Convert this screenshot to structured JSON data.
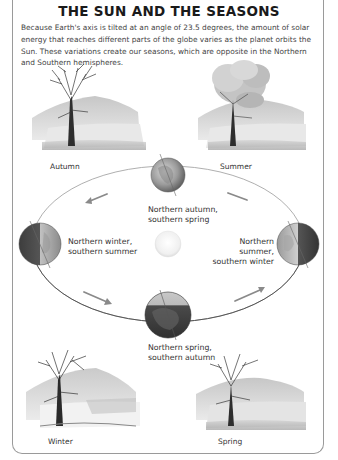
{
  "title": "THE SUN AND THE SEASONS",
  "intro": "Because Earth's axis is tilted at an angle of 23.5 degrees, the amount of solar energy that reaches different parts of the globe varies as the planet orbits the Sun. These variations create our seasons, which are opposite in the Northern and Southern hemispheres.",
  "scenes": [
    {
      "id": "autumn",
      "label": "Autumn"
    },
    {
      "id": "summer",
      "label": "Summer"
    },
    {
      "id": "winter",
      "label": "Winter"
    },
    {
      "id": "spring",
      "label": "Spring"
    }
  ],
  "orbit": {
    "center_label": "Sun",
    "positions": [
      {
        "id": "top",
        "line1": "Northern autumn,",
        "line2": "southern spring"
      },
      {
        "id": "left",
        "line1": "Northern winter,",
        "line2": "southern summer"
      },
      {
        "id": "right",
        "line1": "Northern summer,",
        "line2": "southern winter"
      },
      {
        "id": "bottom",
        "line1": "Northern spring,",
        "line2": "southern autumn"
      }
    ],
    "direction": "counterclockwise"
  },
  "colors": {
    "border": "#9a9a9a",
    "orbit_line": "#555555",
    "arrow": "#8a8a8a",
    "sun": "#f2f2f2",
    "globe_dark": "#4a4a4a",
    "globe_light": "#b8b8b8"
  }
}
